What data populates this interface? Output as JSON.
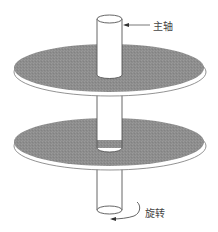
{
  "diagram": {
    "type": "disk-platter-spindle",
    "labels": {
      "spindle": "主轴",
      "rotation": "旋转"
    },
    "colors": {
      "platter_fill": "#8f8f8f",
      "platter_edge": "#ffffff",
      "outline": "#555555",
      "background": "#ffffff"
    },
    "platters": 2
  }
}
